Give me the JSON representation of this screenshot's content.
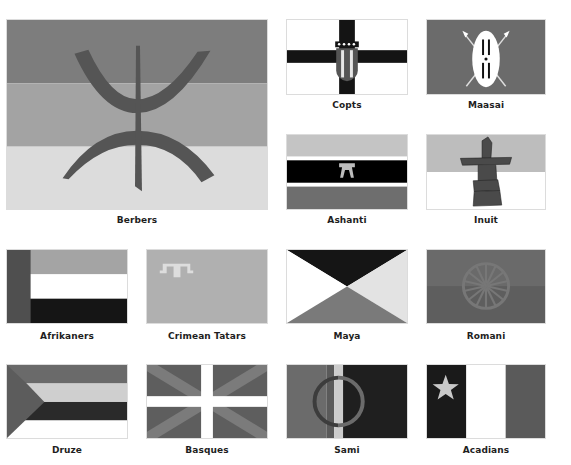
{
  "flags": [
    {
      "id": "berbers",
      "name": "Berbers"
    },
    {
      "id": "copts",
      "name": "Copts"
    },
    {
      "id": "maasai",
      "name": "Maasai"
    },
    {
      "id": "ashanti",
      "name": "Ashanti"
    },
    {
      "id": "inuit",
      "name": "Inuit"
    },
    {
      "id": "afrikaners",
      "name": "Afrikaners"
    },
    {
      "id": "crimean-tatars",
      "name": "Crimean Tatars"
    },
    {
      "id": "maya",
      "name": "Maya"
    },
    {
      "id": "romani",
      "name": "Romani"
    },
    {
      "id": "druze",
      "name": "Druze"
    },
    {
      "id": "basques",
      "name": "Basques"
    },
    {
      "id": "sami",
      "name": "Sami"
    },
    {
      "id": "acadians",
      "name": "Acadians"
    }
  ],
  "colors": {
    "berbers_top": "#7d7d7d",
    "berbers_mid": "#a3a3a3",
    "berbers_bottom": "#dcdcdc",
    "berbers_symbol": "#555555",
    "copts_bg": "#ffffff",
    "copts_cross": "#141414",
    "maasai_bg": "#6b6b6b",
    "ashanti_top": "#c4c4c4",
    "ashanti_mid": "#000000",
    "ashanti_bottom": "#6e6e6e",
    "ashanti_stool": "#bdbdbd",
    "inuit_top": "#bdbdbd",
    "inuit_bottom": "#ffffff",
    "inuit_stone": "#4a4a4a",
    "afrikaners_hoist": "#4f4f4f",
    "afrikaners_top": "#a4a4a4",
    "afrikaners_mid": "#ffffff",
    "afrikaners_bottom": "#151515",
    "tatars_bg": "#b0b0b0",
    "tatars_tamga": "#dddddd",
    "maya_top": "#151515",
    "maya_left": "#ffffff",
    "maya_right": "#e3e3e3",
    "maya_bottom": "#7a7a7a",
    "romani_top": "#6a6a6a",
    "romani_bottom": "#5e5e5e",
    "romani_wheel": "#777777",
    "druze_top": "#6a6a6a",
    "druze_band2": "#cfcfcf",
    "druze_band3": "#2a2a2a",
    "druze_bottom": "#ffffff",
    "druze_tri": "#5c5c5c",
    "basques_bg": "#5e5e5e",
    "basques_saltire": "#7b7b7b",
    "basques_cross": "#ffffff",
    "sami_left": "#6b6b6b",
    "sami_left2": "#5a5a5a",
    "sami_stripe": "#cccccc",
    "sami_right": "#1f1f1f",
    "sami_ring": "#3c3c3c",
    "acadians_left": "#1a1a1a",
    "acadians_mid": "#ffffff",
    "acadians_right": "#5a5a5a",
    "acadians_star": "#c8c8c8"
  }
}
